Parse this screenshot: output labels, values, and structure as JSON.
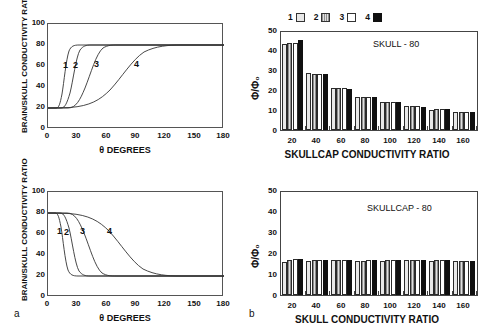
{
  "figure": {
    "panel_a_letter": "a",
    "panel_b_letter": "b"
  },
  "chart_data": [
    {
      "id": "top_left",
      "type": "line",
      "title": "",
      "xlabel": "θ DEGREES",
      "ylabel": "BRAIN/SKULL CONDUCTIVITY RATIO",
      "xlim": [
        0,
        180
      ],
      "ylim": [
        0,
        100
      ],
      "xticks": [
        0,
        30,
        60,
        90,
        120,
        150,
        180
      ],
      "yticks": [
        0,
        20,
        40,
        60,
        80,
        100
      ],
      "grid": false,
      "legend_position": "inline-curve-labels",
      "series": [
        {
          "name": "1",
          "label_x": 14,
          "label_y": 64,
          "midpoint": 13,
          "steepness": 1.7,
          "low": 20,
          "high": 80
        },
        {
          "name": "2",
          "label_x": 24,
          "label_y": 64,
          "midpoint": 22,
          "steepness": 1.3,
          "low": 20,
          "high": 80
        },
        {
          "name": "3",
          "label_x": 44,
          "label_y": 64,
          "midpoint": 38,
          "steepness": 0.8,
          "low": 20,
          "high": 80
        },
        {
          "name": "4",
          "label_x": 84,
          "label_y": 64,
          "midpoint": 80,
          "steepness": 0.32,
          "low": 20,
          "high": 80
        }
      ]
    },
    {
      "id": "bottom_left",
      "type": "line",
      "title": "",
      "xlabel": "θ DEGREES",
      "ylabel": "BRAIN/SKULL CONDUCTIVITY RATIO",
      "xlim": [
        0,
        180
      ],
      "ylim": [
        0,
        100
      ],
      "xticks": [
        0,
        30,
        60,
        90,
        120,
        150,
        180
      ],
      "yticks": [
        0,
        20,
        40,
        60,
        80,
        100
      ],
      "grid": false,
      "legend_position": "inline-curve-labels",
      "series": [
        {
          "name": "1",
          "label_x": 9,
          "label_y": 63,
          "midpoint": 13,
          "steepness": -1.7,
          "low": 80,
          "high": 20
        },
        {
          "name": "2",
          "label_x": 17,
          "label_y": 63,
          "midpoint": 21,
          "steepness": -1.3,
          "low": 80,
          "high": 20
        },
        {
          "name": "3",
          "label_x": 33,
          "label_y": 63,
          "midpoint": 37,
          "steepness": -0.8,
          "low": 80,
          "high": 20
        },
        {
          "name": "4",
          "label_x": 60,
          "label_y": 63,
          "midpoint": 78,
          "steepness": -0.32,
          "low": 80,
          "high": 20
        }
      ]
    },
    {
      "id": "top_right",
      "type": "bar",
      "title": "",
      "annotation": "SKULL - 80",
      "xlabel": "SKULLCAP CONDUCTIVITY RATIO",
      "ylabel": "Φ/Φ₀",
      "categories": [
        "20",
        "40",
        "60",
        "80",
        "100",
        "120",
        "140",
        "160"
      ],
      "xticks": [
        20,
        40,
        60,
        80,
        100,
        120,
        140,
        160
      ],
      "yticks": [
        0,
        10,
        20,
        30,
        40,
        50
      ],
      "ylim": [
        0,
        50
      ],
      "grid": false,
      "legend_position": "top",
      "series": [
        {
          "name": "1",
          "values": [
            44.0,
            28.9,
            21.4,
            16.9,
            14.1,
            12.0,
            10.4,
            9.2
          ]
        },
        {
          "name": "2",
          "values": [
            44.2,
            28.5,
            21.3,
            16.8,
            14.2,
            12.1,
            10.5,
            9.2
          ]
        },
        {
          "name": "3",
          "values": [
            44.5,
            28.4,
            21.4,
            17.0,
            14.2,
            12.2,
            10.6,
            9.3
          ]
        },
        {
          "name": "4",
          "values": [
            46.0,
            28.7,
            21.1,
            16.9,
            14.1,
            11.9,
            10.5,
            9.4
          ]
        }
      ]
    },
    {
      "id": "bottom_right",
      "type": "bar",
      "title": "",
      "annotation": "SKULLCAP - 80",
      "xlabel": "SKULL CONDUCTIVITY RATIO",
      "ylabel": "Φ/Φ₀",
      "categories": [
        "20",
        "40",
        "60",
        "80",
        "100",
        "120",
        "140",
        "160"
      ],
      "xticks": [
        20,
        40,
        60,
        80,
        100,
        120,
        140,
        160
      ],
      "yticks": [
        0,
        10,
        20,
        30,
        40,
        50
      ],
      "ylim": [
        0,
        50
      ],
      "grid": false,
      "legend_position": "none",
      "series": [
        {
          "name": "1",
          "values": [
            16.2,
            16.7,
            16.8,
            16.5,
            16.7,
            16.8,
            16.7,
            16.3
          ]
        },
        {
          "name": "2",
          "values": [
            16.9,
            17.0,
            17.0,
            16.7,
            16.8,
            16.9,
            16.8,
            16.4
          ]
        },
        {
          "name": "3",
          "values": [
            17.4,
            17.2,
            17.1,
            16.8,
            16.9,
            17.0,
            16.9,
            16.5
          ]
        },
        {
          "name": "4",
          "values": [
            17.4,
            17.2,
            17.1,
            16.8,
            16.9,
            17.0,
            16.9,
            16.5
          ]
        }
      ]
    }
  ]
}
